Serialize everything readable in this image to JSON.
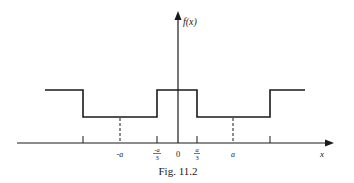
{
  "figure": {
    "caption": "Fig. 11.2",
    "y_axis_label": "f(x)",
    "x_axis_label": "x",
    "origin_label": "0",
    "tick_labels": {
      "neg_a": "-a",
      "neg_a_over_3_num": "-a",
      "neg_a_over_3_den": "3",
      "a_over_3_num": "a",
      "a_over_3_den": "3",
      "a": "a"
    }
  },
  "colors": {
    "stroke": "#1a1a1a",
    "background": "#ffffff"
  }
}
